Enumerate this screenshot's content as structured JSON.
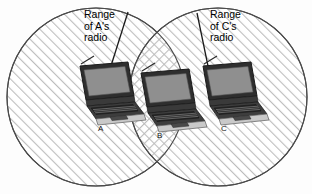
{
  "figure": {
    "background_color": "#fdfdfd",
    "outline_color": "#3a3a3a"
  },
  "ranges": [
    {
      "id": "range-a",
      "label": "Range\nof A's\nradio",
      "label_lines": [
        "Range",
        "of A's",
        "radio"
      ],
      "hatch": "diagonal-forward",
      "cx": 96,
      "cy": 97,
      "r": 89
    },
    {
      "id": "range-c",
      "label": "Range\nof C's\nradio",
      "label_lines": [
        "Range",
        "of C's",
        "radio"
      ],
      "hatch": "diagonal-forward",
      "cx": 218,
      "cy": 97,
      "r": 89
    }
  ],
  "overlap": {
    "id": "overlap-region",
    "hatch": "cross-hatch",
    "contains_node": "B"
  },
  "nodes": [
    {
      "id": "node-a",
      "letter": "A",
      "x": 72,
      "y": 62,
      "has_antenna": true
    },
    {
      "id": "node-b",
      "letter": "B",
      "x": 133,
      "y": 69,
      "has_antenna": true
    },
    {
      "id": "node-c",
      "letter": "C",
      "x": 195,
      "y": 62,
      "has_antenna": true
    }
  ],
  "leader_lines": [
    {
      "id": "leader-a",
      "from_x": 128,
      "from_y": 12,
      "to_x": 110,
      "to_y": 69
    },
    {
      "id": "leader-c",
      "from_x": 197,
      "from_y": 13,
      "to_x": 208,
      "to_y": 66
    }
  ],
  "colors": {
    "hatch_line": "#b9b9b9",
    "circle_stroke": "#4a4a4a",
    "laptop_body_dark": "#2e2e2e",
    "laptop_screen": "#8f8f8f",
    "laptop_base_light": "#c9c9c9",
    "leader_line": "#1a1a1a",
    "text": "#000000"
  }
}
